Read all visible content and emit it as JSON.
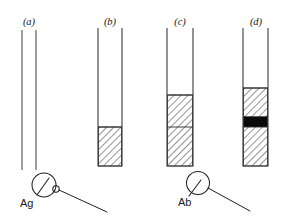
{
  "figure": {
    "background_color": "#ffffff",
    "width": 290,
    "height": 219
  },
  "panels": [
    {
      "id": "a",
      "label": "(a)",
      "label_x": 29,
      "label_y": 25,
      "tube": {
        "left_x": 22,
        "right_x": 36,
        "top_y": 30,
        "bottom_y": 170,
        "closed_bottom": false
      },
      "fills": []
    },
    {
      "id": "b",
      "label": "(b)",
      "label_x": 110,
      "label_y": 25,
      "tube": {
        "left_x": 98,
        "right_x": 122,
        "top_y": 28,
        "bottom_y": 166,
        "closed_bottom": true
      },
      "fills": [
        {
          "kind": "hatch",
          "top_y": 127,
          "bottom_y": 166
        }
      ],
      "dividers": []
    },
    {
      "id": "c",
      "label": "(c)",
      "label_x": 180,
      "label_y": 25,
      "tube": {
        "left_x": 167,
        "right_x": 193,
        "top_y": 28,
        "bottom_y": 166,
        "closed_bottom": true
      },
      "fills": [
        {
          "kind": "hatch",
          "top_y": 95,
          "bottom_y": 166
        }
      ],
      "dividers": [
        127
      ]
    },
    {
      "id": "d",
      "label": "(d)",
      "label_x": 256,
      "label_y": 25,
      "tube": {
        "left_x": 243,
        "right_x": 268,
        "top_y": 28,
        "bottom_y": 166,
        "closed_bottom": true
      },
      "fills": [
        {
          "kind": "hatch",
          "top_y": 88,
          "bottom_y": 117
        },
        {
          "kind": "black",
          "top_y": 117,
          "bottom_y": 127
        },
        {
          "kind": "hatch",
          "top_y": 127,
          "bottom_y": 166
        }
      ],
      "dividers": []
    }
  ],
  "symbols": [
    {
      "id": "ag",
      "name": "antigen",
      "label": "Ag",
      "label_x": 20,
      "label_y": 207,
      "circle": {
        "cx": 44,
        "cy": 185,
        "r": 12
      },
      "inner_tick": {
        "x1": 49,
        "y1": 178,
        "x2": 37,
        "y2": 195
      },
      "small_circle": {
        "cx": 56,
        "cy": 189,
        "r": 3.2
      },
      "leader": {
        "x1": 59,
        "y1": 190,
        "x2": 107,
        "y2": 212
      }
    },
    {
      "id": "ab",
      "name": "antibody",
      "label": "Ab",
      "label_x": 178,
      "label_y": 206,
      "circle": {
        "cx": 198,
        "cy": 183,
        "r": 11.5
      },
      "inner_tick": {
        "x1": 201,
        "y1": 180,
        "x2": 189,
        "y2": 196
      },
      "small_circle": null,
      "leader": {
        "x1": 208,
        "y1": 188,
        "x2": 250,
        "y2": 211
      }
    }
  ],
  "colors": {
    "ink": "#1f1f1f",
    "tube_stroke": "#555555",
    "hatch_stroke": "#2b2b2b",
    "band_black": "#0a0a0a",
    "paper": "#ffffff"
  }
}
